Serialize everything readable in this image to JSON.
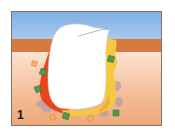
{
  "figure": {
    "panel_label": "1",
    "colors": {
      "sky": "#7fb0e4",
      "gum_band": "#d9783d",
      "tissue_top": "#fbe3d0",
      "tissue_bottom": "#eea878",
      "tooth": "#ffffff",
      "inflamed_layer": "#e8451e",
      "yellow_layer": "#f5c842",
      "green_marker": "#4f9a52",
      "orange_marker": "#f0a050",
      "gray_cells": "#b8a2a8"
    }
  }
}
